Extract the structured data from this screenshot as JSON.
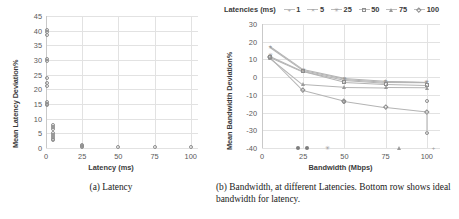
{
  "figure": {
    "panels": [
      {
        "id": "a",
        "caption": "(a) Latency"
      },
      {
        "id": "b",
        "caption": "(b) Bandwidth, at different Latencies. Bottom row shows ideal bandwidth for latency."
      }
    ]
  },
  "chart_data": [
    {
      "type": "scatter",
      "title": "",
      "xlabel": "Latency (ms)",
      "ylabel": "Mean Latency Deviation%",
      "xlim": [
        0,
        105
      ],
      "ylim": [
        0,
        45
      ],
      "xticks": [
        "0",
        "25",
        "50",
        "75",
        "100"
      ],
      "xtick_values": [
        0,
        25,
        50,
        75,
        100
      ],
      "yticks": [
        "0",
        "5",
        "10",
        "15",
        "20",
        "25",
        "30",
        "35",
        "40",
        "45"
      ],
      "ytick_values": [
        0,
        5,
        10,
        15,
        20,
        25,
        30,
        35,
        40,
        45
      ],
      "grid": true,
      "legend": "none",
      "marker": "open-circle",
      "points": [
        {
          "x": 1,
          "y": 40.2
        },
        {
          "x": 1,
          "y": 39.4
        },
        {
          "x": 1,
          "y": 38.6
        },
        {
          "x": 1,
          "y": 30.2
        },
        {
          "x": 1,
          "y": 29.5
        },
        {
          "x": 1,
          "y": 24.0
        },
        {
          "x": 1,
          "y": 22.0
        },
        {
          "x": 1,
          "y": 21.2
        },
        {
          "x": 1,
          "y": 15.6
        },
        {
          "x": 1,
          "y": 15.0
        },
        {
          "x": 1,
          "y": 14.6
        },
        {
          "x": 5,
          "y": 7.8
        },
        {
          "x": 5,
          "y": 7.2
        },
        {
          "x": 5,
          "y": 6.6
        },
        {
          "x": 5,
          "y": 5.0
        },
        {
          "x": 5,
          "y": 4.4
        },
        {
          "x": 5,
          "y": 3.6
        },
        {
          "x": 5,
          "y": 3.0
        },
        {
          "x": 5,
          "y": 2.6
        },
        {
          "x": 25,
          "y": 1.1
        },
        {
          "x": 25,
          "y": 0.7
        },
        {
          "x": 25,
          "y": 0.4
        },
        {
          "x": 50,
          "y": 0.3
        },
        {
          "x": 75,
          "y": 0.25
        },
        {
          "x": 100,
          "y": 0.2
        }
      ]
    },
    {
      "type": "line",
      "title": "",
      "xlabel": "Bandwidth (Mbps)",
      "ylabel": "Mean Bandwidth Deviation%",
      "xlim": [
        0,
        108
      ],
      "ylim": [
        -40,
        30
      ],
      "xticks": [
        "0",
        "25",
        "50",
        "75",
        "100"
      ],
      "xtick_values": [
        0,
        25,
        50,
        75,
        100
      ],
      "yticks": [
        "30",
        "20",
        "10",
        "0",
        "-10",
        "-20",
        "-30",
        "-40"
      ],
      "ytick_values": [
        30,
        20,
        10,
        0,
        -10,
        -20,
        -30,
        -40
      ],
      "grid": true,
      "legend_title": "Latencies (ms)",
      "legend_position": "top",
      "x": [
        5,
        25,
        50,
        75,
        100
      ],
      "series": [
        {
          "name": "1",
          "marker": "plus",
          "values": [
            17.5,
            4.5,
            -0.5,
            -2.0,
            -2.5
          ]
        },
        {
          "name": "5",
          "marker": "x",
          "values": [
            17.0,
            4.0,
            -0.8,
            -2.3,
            -2.8
          ]
        },
        {
          "name": "25",
          "marker": "star",
          "values": [
            12.0,
            3.5,
            -1.5,
            -3.0,
            -3.2
          ]
        },
        {
          "name": "50",
          "marker": "open-square",
          "values": [
            11.5,
            3.2,
            -2.8,
            -4.0,
            -4.5
          ]
        },
        {
          "name": "75",
          "marker": "open-triangle",
          "values": [
            11.0,
            -4.0,
            -5.5,
            -5.8,
            -6.0
          ]
        },
        {
          "name": "100",
          "marker": "open-diamond",
          "values": [
            11.2,
            -7.5,
            -13.5,
            -17.0,
            -19.5
          ]
        }
      ],
      "extra_points": [
        {
          "name": "outlier-100-low",
          "x": 100,
          "y": -31.5,
          "marker": "open-circle"
        },
        {
          "name": "outlier-100-mid",
          "x": 100,
          "y": -13.5,
          "marker": "open-circle"
        },
        {
          "name": "outlier-50-low",
          "x": 50,
          "y": -14.0,
          "marker": "open-circle"
        }
      ],
      "ideal_row": {
        "label": "Bottom row shows ideal bandwidth for latency.",
        "y": -40,
        "points": [
          {
            "x": 22,
            "marker": "filled-circle"
          },
          {
            "x": 27,
            "marker": "filled-circle"
          },
          {
            "x": 40,
            "marker": "star"
          },
          {
            "x": 83,
            "marker": "filled-triangle"
          },
          {
            "x": 104,
            "marker": "plus"
          }
        ]
      }
    }
  ]
}
